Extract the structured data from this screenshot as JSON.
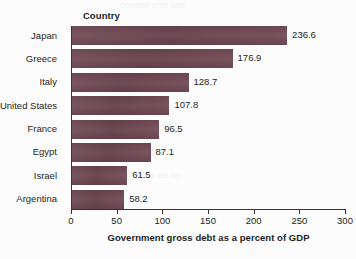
{
  "chart_data": {
    "type": "bar",
    "orientation": "horizontal",
    "title": "",
    "category_axis_title": "Country",
    "xlabel": "Government gross debt as a percent of GDP",
    "ylabel": "Country",
    "xlim": [
      0,
      300
    ],
    "xticks": [
      0,
      50,
      100,
      150,
      200,
      250,
      300
    ],
    "grid": false,
    "legend": false,
    "bar_color": "#6d4551",
    "categories": [
      "Japan",
      "Greece",
      "Italy",
      "United States",
      "France",
      "Egypt",
      "Israel",
      "Argentina"
    ],
    "values": [
      236.6,
      176.9,
      128.7,
      107.8,
      96.5,
      87.1,
      61.5,
      58.2
    ],
    "value_labels": [
      "236.6",
      "176.9",
      "128.7",
      "107.8",
      "96.5",
      "87.1",
      "61.5",
      "58.2"
    ],
    "bars": [
      {
        "category": "Japan",
        "value": 236.6,
        "label": "236.6"
      },
      {
        "category": "Greece",
        "value": 176.9,
        "label": "176.9"
      },
      {
        "category": "Italy",
        "value": 128.7,
        "label": "128.7"
      },
      {
        "category": "United States",
        "value": 107.8,
        "label": "107.8"
      },
      {
        "category": "France",
        "value": 96.5,
        "label": "96.5"
      },
      {
        "category": "Egypt",
        "value": 87.1,
        "label": "87.1"
      },
      {
        "category": "Israel",
        "value": 61.5,
        "label": "61.5"
      },
      {
        "category": "Argentina",
        "value": 58.2,
        "label": "58.2"
      }
    ]
  },
  "axis": {
    "tick_labels": [
      "0",
      "50",
      "100",
      "150",
      "200",
      "250",
      "300"
    ],
    "title": "Government gross debt as a percent of GDP"
  },
  "category_header": "Country"
}
